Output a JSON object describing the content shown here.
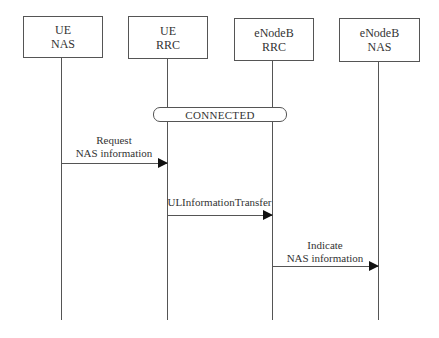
{
  "diagram": {
    "type": "sequence",
    "participants": [
      {
        "line1": "UE",
        "line2": "NAS"
      },
      {
        "line1": "UE",
        "line2": "RRC"
      },
      {
        "line1": "eNodeB",
        "line2": "RRC"
      },
      {
        "line1": "eNodeB",
        "line2": "NAS"
      }
    ],
    "state": {
      "label": "CONNECTED"
    },
    "messages": [
      {
        "line1": "Request",
        "line2": "NAS information",
        "from": "UE NAS",
        "to": "UE RRC"
      },
      {
        "line1": "ULInformationTransfer",
        "from": "UE RRC",
        "to": "eNodeB RRC"
      },
      {
        "line1": "Indicate",
        "line2": "NAS information",
        "from": "eNodeB RRC",
        "to": "eNodeB NAS"
      }
    ]
  }
}
